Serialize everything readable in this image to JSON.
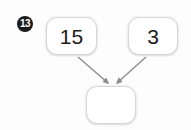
{
  "problem": {
    "number_badge": "13",
    "type": "number-bond-diagram",
    "operands": [
      {
        "id": "a",
        "value": "15"
      },
      {
        "id": "b",
        "value": "3"
      }
    ],
    "result": {
      "id": "result",
      "value": ""
    },
    "result_placeholder": ""
  },
  "colors": {
    "badge_fill": "#1b1b1b",
    "badge_text": "#ffffff",
    "box_border": "#d6d6d6",
    "box_fill": "#ffffff",
    "text": "#1a1a1a",
    "arrow": "#8d8d8d",
    "background": "#fdfdfd"
  },
  "arrows": [
    {
      "name": "arrow-from-a-to-result",
      "from": "a",
      "to": "result"
    },
    {
      "name": "arrow-from-b-to-result",
      "from": "b",
      "to": "result"
    }
  ]
}
